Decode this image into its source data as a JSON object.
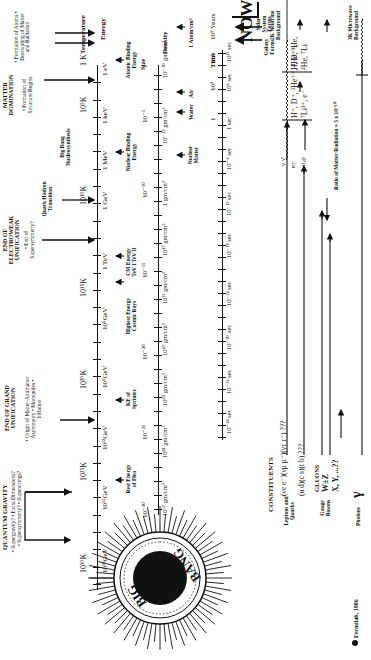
{
  "eras": [
    {
      "title": "QUANTUM GRAVITY",
      "items": [
        "• Supergravity?",
        "• Extra Dimensions?",
        "• Supersymmetry?",
        "• Superstrings?"
      ]
    },
    {
      "title": "END OF GRAND UNIFICATION",
      "items": [
        "• Origin of",
        "Matter-Antimatter",
        "Asymmetry",
        "• Monopoles",
        "• Inflation"
      ]
    },
    {
      "title": "END OF ELECTROWEAK UNIFICATION",
      "items": [
        "• End of",
        "Supersymmetry?"
      ]
    },
    {
      "title": "Quark Hadron Transition",
      "items": []
    },
    {
      "title": "Big Bang Nucleosynthesis",
      "items": []
    },
    {
      "title": "MATTER DOMINATION",
      "items": [
        "• Formation of",
        "Structure",
        "Begins"
      ]
    },
    {
      "title": "",
      "items": [
        "• Formation",
        "of Atoms",
        "• Decoupling of",
        "Matter and",
        "Radiation"
      ]
    }
  ],
  "axes": {
    "temperature": {
      "label": "Temperature",
      "ticks": [
        "10³⁰K",
        "10²⁵K",
        "10²⁰K",
        "10¹⁵K",
        "10¹⁰K",
        "10⁵K",
        "1 K"
      ]
    },
    "energy": {
      "label": "Energy",
      "ticks": [
        "10¹⁸GeV",
        "10¹⁵GeV",
        "10¹²GeV",
        "10⁹GeV",
        "10⁶GeV",
        "1 TeV",
        "1 GeV",
        "1 MeV",
        "1 keV",
        "1 eV",
        "1 meV"
      ]
    },
    "size": {
      "label": "Size",
      "ticks": [
        "10⁻³⁰",
        "10⁻²⁵",
        "10⁻²⁰",
        "10⁻¹⁵",
        "10⁻¹⁰",
        "10⁻⁵",
        "1"
      ]
    },
    "density": {
      "label": "Density",
      "ticks": [
        "10⁹⁷ gm/cm³",
        "10⁸¹ gm/cm³",
        "10⁶⁵ gm/cm³",
        "10⁴⁹ gm/cm³",
        "10³³ gm/cm³",
        "10¹⁷ gm/cm³",
        "1 gm/cm³",
        "10⁻¹⁵ gm/cm³",
        "10⁻³⁰ gm/cm³"
      ]
    },
    "time": {
      "label": "Time",
      "ticks": [
        "10⁻⁴² sec",
        "10⁻³⁶ sec",
        "10⁻³⁰ sec",
        "10⁻²⁴ sec",
        "10⁻¹⁸ sec",
        "10⁻¹² sec",
        "10⁻⁶ sec",
        "1 sec",
        "10⁶ sec",
        "10¹² sec",
        "10¹⁸ sec"
      ]
    },
    "years": {
      "ticks": [
        "1",
        "10³",
        "10⁶",
        "10⁹ Years"
      ]
    }
  },
  "annotations": {
    "rest_energy_flea": "Rest Energy of Flea",
    "ke_sprinter": "KE of Sprinter",
    "cosmic_rays": "Highest Energy Cosmic Rays",
    "cm_energy": "CM Energy TeV I  TeV II",
    "nuclear_binding": "Nuclear Binding Energy",
    "atomic_binding": "Atomic Binding Energy",
    "nuclear_matter": "Nuclear Matter",
    "water": "Water",
    "air": "Air",
    "one_atom": "1 Atom/cm³",
    "galaxy_forms": "Galaxy Forms",
    "solar_system": "Solar System Forms",
    "now": "NOW"
  },
  "constituents": {
    "title": "CONSTITUENTS",
    "leptons_label": "Leptons and Quarks",
    "leptons_row": "(νe e⁻)(νμ μ⁻)(ντ τ⁻) ???",
    "quarks_row": "(u d)(c s)(t b) ???",
    "gauge_label": "Gauge Bosons",
    "gluons": "GLUONS",
    "wz": "W±Z",
    "xy": "X, Y, ...??",
    "photons_label": "Photons",
    "photon_symbol": "γ",
    "nu_nubar": "ν ν̄",
    "e_pm": "e±",
    "n_p": "n,p",
    "nuclei_early": "H⁺, D⁺, ³He⁺⁺, ⁴He⁺⁺, ⁷Li³⁺, e⁻",
    "nuclei_late": "H, D, ³He, ⁴He, ⁷Li",
    "neutrino_bg": "2K Neutrino Background",
    "microwave_bg": "3K Microwave Background",
    "ratio": "Ratio of Matter/Radiation ≈ 5 x 10⁻¹⁰"
  },
  "big_bang": {
    "word1": "BIG",
    "word2": "BANG"
  },
  "credit": "Fermilab, 1986"
}
